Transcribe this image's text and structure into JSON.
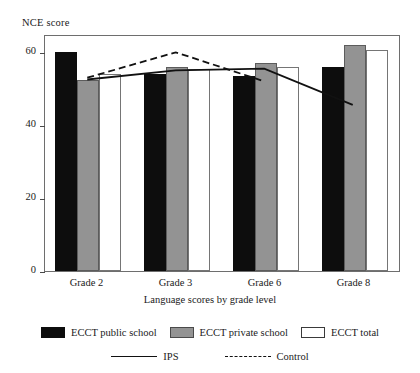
{
  "chart_data": {
    "type": "bar",
    "title": "",
    "ylabel": "NCE score",
    "xlabel": "Language scores by grade level",
    "categories": [
      "Grade 2",
      "Grade 3",
      "Grade 6",
      "Grade 8"
    ],
    "ylim": [
      0,
      65
    ],
    "yticks": [
      0,
      20,
      40,
      60
    ],
    "ytick_labels": [
      "0",
      "20",
      "40",
      "60"
    ],
    "grid": false,
    "legend_position": "bottom",
    "series": [
      {
        "name": "ECCT public school",
        "type": "bar",
        "color": "#0d0d0d",
        "values": [
          60.0,
          54.0,
          53.5,
          56.0
        ]
      },
      {
        "name": "ECCT private school",
        "type": "bar",
        "color": "#939393",
        "values": [
          52.5,
          56.0,
          57.0,
          62.0
        ]
      },
      {
        "name": "ECCT total",
        "type": "bar",
        "color": "#ffffff",
        "values": [
          54.0,
          55.5,
          56.0,
          60.5
        ]
      },
      {
        "name": "IPS",
        "type": "line",
        "style": "solid",
        "color": "#111111",
        "values": [
          53.0,
          55.5,
          56.0,
          46.0
        ]
      },
      {
        "name": "Control",
        "type": "line",
        "style": "dashed",
        "color": "#111111",
        "values": [
          53.5,
          60.5,
          52.5,
          null
        ]
      }
    ]
  },
  "legend": {
    "bars": [
      {
        "label": "ECCT public school",
        "swatch": "black"
      },
      {
        "label": "ECCT private school",
        "swatch": "gray"
      },
      {
        "label": "ECCT total",
        "swatch": "white"
      }
    ],
    "lines": [
      {
        "label": "IPS",
        "style": "solid"
      },
      {
        "label": "Control",
        "style": "dashed"
      }
    ]
  }
}
